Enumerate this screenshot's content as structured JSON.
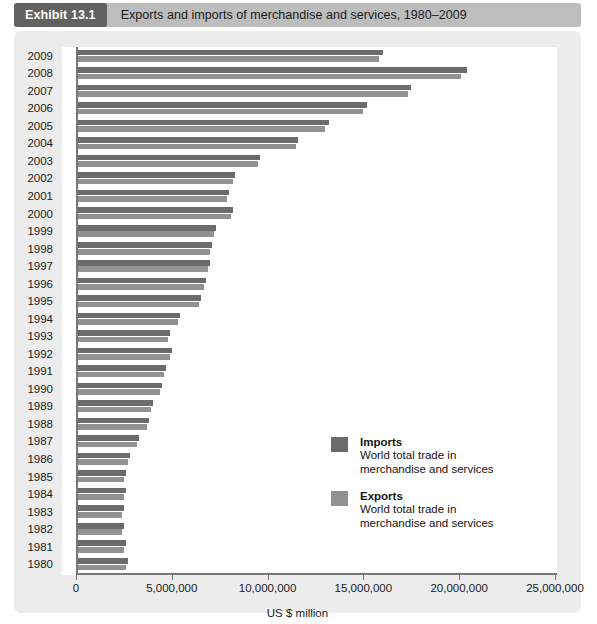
{
  "header": {
    "badge": "Exhibit 13.1",
    "title": "Exports and imports of merchandise and services, 1980–2009"
  },
  "legend": {
    "imports": {
      "label": "Imports",
      "description_line1": "World total trade in",
      "description_line2": "merchandise and services",
      "color": "#6b6b6b"
    },
    "exports": {
      "label": "Exports",
      "description_line1": "World total trade in",
      "description_line2": "merchandise and services",
      "color": "#929292"
    }
  },
  "chart_data": {
    "type": "bar",
    "orientation": "horizontal",
    "title": "Exports and imports of merchandise and services, 1980–2009",
    "xlabel": "US $ million",
    "ylabel": "",
    "xlim": [
      0,
      25000000
    ],
    "xticks": [
      0,
      5000000,
      10000000,
      15000000,
      20000000,
      25000000
    ],
    "xtick_labels": [
      "0",
      "5,000,000",
      "10,000,000",
      "15,000,000",
      "20,000,000",
      "25,000,000"
    ],
    "grid": false,
    "legend_position": "inside-right",
    "categories": [
      "2009",
      "2008",
      "2007",
      "2006",
      "2005",
      "2004",
      "2003",
      "2002",
      "2001",
      "2000",
      "1999",
      "1998",
      "1997",
      "1996",
      "1995",
      "1994",
      "1993",
      "1992",
      "1991",
      "1990",
      "1989",
      "1988",
      "1987",
      "1986",
      "1985",
      "1984",
      "1983",
      "1982",
      "1981",
      "1980"
    ],
    "series": [
      {
        "name": "Imports",
        "color": "#6b6b6b",
        "values": [
          15900000,
          20300000,
          17400000,
          15100000,
          13100000,
          11500000,
          9500000,
          8200000,
          7900000,
          8100000,
          7200000,
          7000000,
          6900000,
          6700000,
          6400000,
          5300000,
          4800000,
          4900000,
          4600000,
          4400000,
          3900000,
          3700000,
          3200000,
          2700000,
          2500000,
          2500000,
          2400000,
          2400000,
          2500000,
          2600000
        ]
      },
      {
        "name": "Exports",
        "color": "#929292",
        "values": [
          15700000,
          20000000,
          17200000,
          14900000,
          12900000,
          11400000,
          9400000,
          8100000,
          7800000,
          8000000,
          7100000,
          6900000,
          6800000,
          6600000,
          6300000,
          5200000,
          4700000,
          4800000,
          4500000,
          4300000,
          3800000,
          3600000,
          3100000,
          2600000,
          2400000,
          2400000,
          2300000,
          2300000,
          2400000,
          2500000
        ]
      }
    ]
  }
}
